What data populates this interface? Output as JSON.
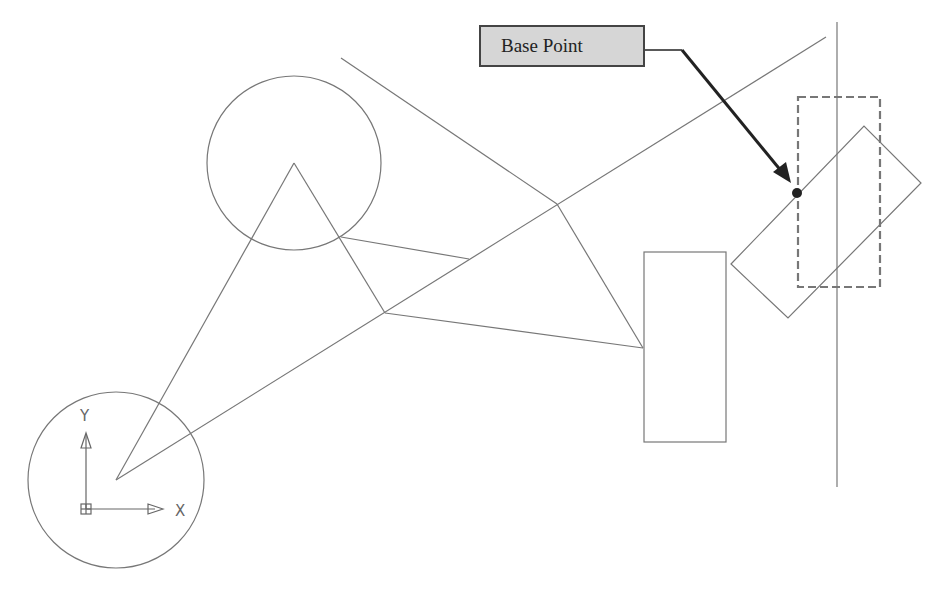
{
  "callout": {
    "label": "Base Point"
  },
  "ucs": {
    "x_label": "X",
    "y_label": "Y"
  },
  "colors": {
    "line": "#777777",
    "callout_fill": "#d6d6d6",
    "callout_border": "#444444",
    "arrow": "#222222"
  }
}
